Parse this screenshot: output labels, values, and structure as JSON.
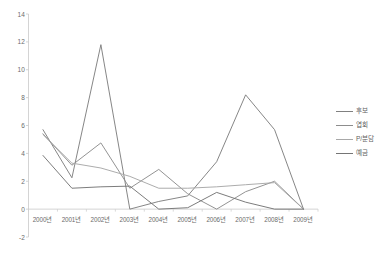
{
  "chart_data": {
    "type": "line",
    "title": "",
    "xlabel": "",
    "ylabel": "",
    "categories": [
      "2000년",
      "2001년",
      "2002년",
      "2003년",
      "2004년",
      "2005년",
      "2006년",
      "2007년",
      "2008년",
      "2009년"
    ],
    "ylim": [
      -2,
      14
    ],
    "y_ticks": [
      -2,
      0,
      2,
      4,
      6,
      8,
      10,
      12,
      14
    ],
    "grid": false,
    "legend_position": "right",
    "series": [
      {
        "name": "후보",
        "color": "#808080",
        "values": [
          5.7,
          2.25,
          11.8,
          0.0,
          0.55,
          0.95,
          3.4,
          8.2,
          5.7,
          0.0
        ]
      },
      {
        "name": "엽회",
        "color": "#8d8d8d",
        "values": [
          5.4,
          3.15,
          4.75,
          1.5,
          2.85,
          1.1,
          0.0,
          1.25,
          2.0,
          0.0
        ]
      },
      {
        "name": "P/분담",
        "color": "#a8a8a8",
        "values": [
          5.35,
          3.3,
          2.95,
          2.35,
          1.5,
          1.5,
          1.6,
          1.75,
          1.9,
          0.0
        ]
      },
      {
        "name": "예금",
        "color": "#757575",
        "values": [
          3.85,
          1.5,
          1.6,
          1.65,
          0.0,
          0.1,
          1.2,
          0.5,
          0.0,
          0.0
        ]
      }
    ]
  },
  "legend": {
    "items": [
      {
        "label": "후보"
      },
      {
        "label": "엽회"
      },
      {
        "label": "P/분담"
      },
      {
        "label": "예금"
      }
    ]
  },
  "axis": {
    "y_tick_labels": [
      "14",
      "12",
      "10",
      "8",
      "6",
      "4",
      "2",
      "0",
      "-2"
    ],
    "x_tick_labels": [
      "2000년",
      "2001년",
      "2002년",
      "2003년",
      "2004년",
      "2005년",
      "2006년",
      "2007년",
      "2008년",
      "2009년"
    ]
  },
  "caption": {
    "text": ""
  }
}
